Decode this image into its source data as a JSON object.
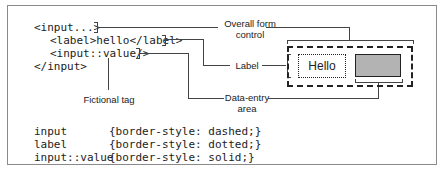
{
  "code": {
    "line1": "<input...>",
    "line2": "<label>hello</label>",
    "line3": "<input::value/>",
    "line4": "</input>"
  },
  "callouts": {
    "overall_line1": "Overall form",
    "overall_line2": "control",
    "label": "Label",
    "data_entry_line1": "Data-entry",
    "data_entry_line2": "area",
    "fictional": "Fictional tag"
  },
  "preview": {
    "label_text": "Hello",
    "value_fill": "#b3b3b3"
  },
  "css_rules": [
    {
      "selector": "input",
      "declaration": "{border-style: dashed;}"
    },
    {
      "selector": "label",
      "declaration": "{border-style: dotted;}"
    },
    {
      "selector": "input::value",
      "declaration": "{border-style: solid;}"
    }
  ]
}
